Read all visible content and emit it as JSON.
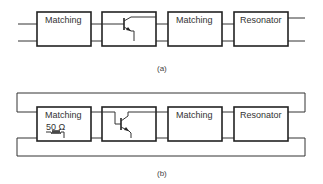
{
  "figure_a": {
    "caption": "(a)",
    "blocks": [
      {
        "id": "matching-1",
        "label": "Matching"
      },
      {
        "id": "transistor",
        "label": ""
      },
      {
        "id": "matching-2",
        "label": "Matching"
      },
      {
        "id": "resonator",
        "label": "Resonator"
      }
    ]
  },
  "figure_b": {
    "caption": "(b)",
    "blocks": [
      {
        "id": "matching-1",
        "label": "Matching",
        "sublabel": "50 Ω"
      },
      {
        "id": "transistor",
        "label": ""
      },
      {
        "id": "matching-2",
        "label": "Matching"
      },
      {
        "id": "resonator",
        "label": "Resonator"
      }
    ]
  }
}
